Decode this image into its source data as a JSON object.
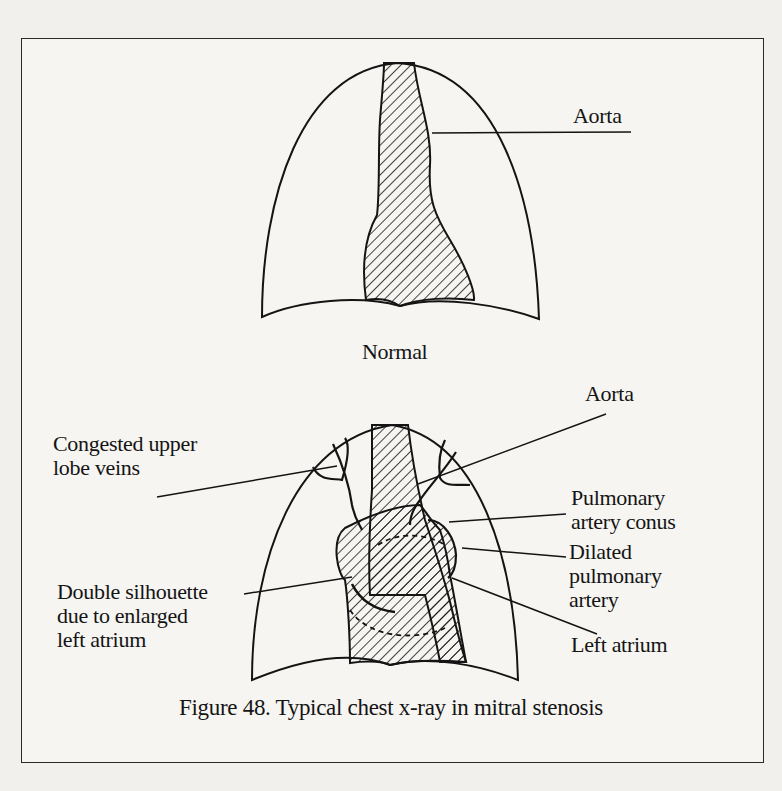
{
  "figure": {
    "number": "48",
    "caption": "Figure 48. Typical chest x-ray in mitral stenosis"
  },
  "panels": {
    "normal": {
      "title": "Normal",
      "labels": {
        "aorta": "Aorta"
      }
    },
    "mitral_stenosis": {
      "labels": {
        "congested_veins": "Congested upper\nlobe veins",
        "double_silhouette": "Double silhouette\ndue to enlarged\nleft atrium",
        "aorta": "Aorta",
        "pulmonary_conus": "Pulmonary\nartery conus",
        "dilated_pa": "Dilated\npulmonary\nartery",
        "left_atrium": "Left atrium"
      }
    }
  },
  "colors": {
    "ink": "#141414",
    "paper": "#f6f5f2"
  }
}
